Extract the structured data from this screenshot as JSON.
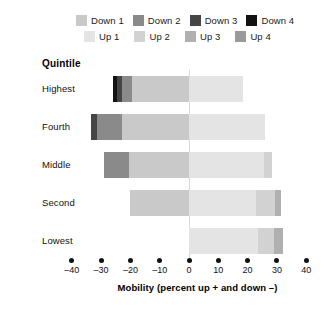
{
  "legend": {
    "rows": [
      {
        "items": [
          {
            "label": "Down 1",
            "color": "#c9c9c9",
            "key": "down1"
          },
          {
            "label": "Down 2",
            "color": "#8a8a8a",
            "key": "down2"
          },
          {
            "label": "Down 3",
            "color": "#454545",
            "key": "down3"
          },
          {
            "label": "Down 4",
            "color": "#121212",
            "key": "down4"
          }
        ]
      },
      {
        "items": [
          {
            "label": "Up 1",
            "color": "#e4e4e4",
            "key": "up1"
          },
          {
            "label": "Up 2",
            "color": "#d2d2d2",
            "key": "up2"
          },
          {
            "label": "Up 3",
            "color": "#b0b0b0",
            "key": "up3"
          },
          {
            "label": "Up 4",
            "color": "#9a9a9a",
            "key": "up4"
          }
        ]
      }
    ]
  },
  "group_heading": "Quintile",
  "axis": {
    "title": "Mobility (percent up + and down –)",
    "ticks": [
      "–40",
      "–30",
      "–20",
      "–10",
      "0",
      "10",
      "20",
      "30",
      "40"
    ],
    "tick_values": [
      -40,
      -30,
      -20,
      -10,
      0,
      10,
      20,
      30,
      40
    ]
  },
  "chart_data": {
    "type": "bar",
    "title": "",
    "subtitle": "",
    "orientation": "horizontal",
    "stacked": true,
    "diverging": true,
    "xlabel": "Mobility (percent up + and down –)",
    "ylabel": "Quintile",
    "xlim": [
      -40,
      40
    ],
    "grid": false,
    "legend_position": "top",
    "categories": [
      "Highest",
      "Fourth",
      "Middle",
      "Second",
      "Lowest"
    ],
    "series": [
      {
        "name": "Down 4",
        "color": "#121212",
        "values": [
          -1.5,
          0,
          0,
          0,
          0
        ]
      },
      {
        "name": "Down 3",
        "color": "#454545",
        "values": [
          -1.5,
          -2.0,
          0,
          0,
          0
        ]
      },
      {
        "name": "Down 2",
        "color": "#8a8a8a",
        "values": [
          -3.5,
          -8.5,
          -8.5,
          0,
          0
        ]
      },
      {
        "name": "Down 1",
        "color": "#c9c9c9",
        "values": [
          -19.5,
          -23.0,
          -20.5,
          -20.0,
          0
        ]
      },
      {
        "name": "Up 1",
        "color": "#e4e4e4",
        "values": [
          18.5,
          26.0,
          25.5,
          23.0,
          23.5
        ]
      },
      {
        "name": "Up 2",
        "color": "#d2d2d2",
        "values": [
          0,
          0,
          3.0,
          6.5,
          5.5
        ]
      },
      {
        "name": "Up 3",
        "color": "#b0b0b0",
        "values": [
          0,
          0,
          0,
          2.0,
          3.0
        ]
      },
      {
        "name": "Up 4",
        "color": "#9a9a9a",
        "values": [
          0,
          0,
          0,
          0,
          0
        ]
      }
    ],
    "totals_down": [
      -26.0,
      -33.5,
      -29.0,
      -20.0,
      0
    ],
    "totals_up": [
      18.5,
      26.0,
      28.5,
      31.5,
      32.0
    ]
  }
}
